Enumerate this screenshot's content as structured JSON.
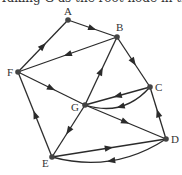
{
  "caption": "Taking G as the root node in the digraph",
  "graph": {
    "directed": true,
    "colors": {
      "edge": "#2b2b2b",
      "node": "#444444",
      "label": "#333333",
      "background": "#ffffff"
    },
    "nodes": [
      {
        "id": "A",
        "x": 68,
        "y": 20,
        "label": "A",
        "lx": 64,
        "ly": 15
      },
      {
        "id": "B",
        "x": 117,
        "y": 37,
        "label": "B",
        "lx": 116,
        "ly": 31
      },
      {
        "id": "C",
        "x": 150,
        "y": 87,
        "label": "C",
        "lx": 155,
        "ly": 91
      },
      {
        "id": "D",
        "x": 166,
        "y": 139,
        "label": "D",
        "lx": 171,
        "ly": 143
      },
      {
        "id": "E",
        "x": 52,
        "y": 157,
        "label": "E",
        "lx": 42,
        "ly": 167
      },
      {
        "id": "F",
        "x": 18,
        "y": 72,
        "label": "F",
        "lx": 7,
        "ly": 76
      },
      {
        "id": "G",
        "x": 85,
        "y": 105,
        "label": "G",
        "lx": 71,
        "ly": 111
      }
    ],
    "edges": [
      {
        "from": "A",
        "to": "B",
        "curved": false
      },
      {
        "from": "F",
        "to": "A",
        "curved": false
      },
      {
        "from": "B",
        "to": "F",
        "curved": false
      },
      {
        "from": "B",
        "to": "C",
        "curved": false
      },
      {
        "from": "F",
        "to": "G",
        "curved": false
      },
      {
        "from": "G",
        "to": "B",
        "curved": false
      },
      {
        "from": "C",
        "to": "G",
        "curved": false
      },
      {
        "from": "C",
        "to": "G",
        "curved": true
      },
      {
        "from": "G",
        "to": "D",
        "curved": false
      },
      {
        "from": "G",
        "to": "E",
        "curved": false
      },
      {
        "from": "E",
        "to": "F",
        "curved": false
      },
      {
        "from": "E",
        "to": "D",
        "curved": false
      },
      {
        "from": "D",
        "to": "E",
        "curved": true
      },
      {
        "from": "D",
        "to": "C",
        "curved": false
      }
    ]
  }
}
